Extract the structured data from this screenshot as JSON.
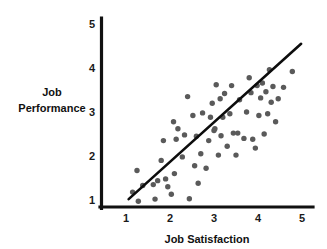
{
  "chart_data": {
    "type": "scatter",
    "title": "",
    "xlabel": "Job Satisfaction",
    "ylabel": "Job Performance",
    "ylabel_line1": "Job",
    "ylabel_line2": "Performance",
    "xlim": [
      0.62,
      5.25
    ],
    "ylim": [
      0.62,
      5.15
    ],
    "xticks": [
      1,
      2,
      3,
      4,
      5
    ],
    "yticks": [
      1,
      2,
      3,
      4,
      5
    ],
    "xtick_labels": [
      "1",
      "2",
      "3",
      "4",
      "5"
    ],
    "ytick_labels": [
      "1",
      "2",
      "3",
      "4",
      "5"
    ],
    "grid": false,
    "legend": false,
    "legend_position": "none",
    "marker_color": "#5a5a5a",
    "marker_size_px": 5.4,
    "axis_color": "#111111",
    "trendline": {
      "label": "linear fit",
      "color": "#0d0d0d",
      "x_start": 1.06,
      "y_start": 1.02,
      "x_end": 4.98,
      "y_end": 4.55
    },
    "points": [
      {
        "x": 1.15,
        "y": 1.18
      },
      {
        "x": 1.25,
        "y": 1.67
      },
      {
        "x": 1.28,
        "y": 0.97
      },
      {
        "x": 1.38,
        "y": 1.33
      },
      {
        "x": 1.62,
        "y": 1.35
      },
      {
        "x": 1.66,
        "y": 1.02
      },
      {
        "x": 1.72,
        "y": 1.44
      },
      {
        "x": 1.8,
        "y": 1.9
      },
      {
        "x": 1.85,
        "y": 2.35
      },
      {
        "x": 1.95,
        "y": 1.3
      },
      {
        "x": 2.03,
        "y": 1.13
      },
      {
        "x": 2.08,
        "y": 2.78
      },
      {
        "x": 2.1,
        "y": 1.6
      },
      {
        "x": 2.14,
        "y": 2.38
      },
      {
        "x": 2.18,
        "y": 2.62
      },
      {
        "x": 2.28,
        "y": 1.98
      },
      {
        "x": 2.33,
        "y": 2.48
      },
      {
        "x": 2.4,
        "y": 3.35
      },
      {
        "x": 2.44,
        "y": 1.03
      },
      {
        "x": 2.52,
        "y": 2.92
      },
      {
        "x": 2.56,
        "y": 1.78
      },
      {
        "x": 2.6,
        "y": 2.45
      },
      {
        "x": 2.64,
        "y": 1.38
      },
      {
        "x": 2.7,
        "y": 2.05
      },
      {
        "x": 2.82,
        "y": 1.72
      },
      {
        "x": 2.88,
        "y": 2.35
      },
      {
        "x": 2.92,
        "y": 2.88
      },
      {
        "x": 2.96,
        "y": 3.2
      },
      {
        "x": 3.0,
        "y": 2.58
      },
      {
        "x": 3.05,
        "y": 3.62
      },
      {
        "x": 3.1,
        "y": 2.02
      },
      {
        "x": 3.14,
        "y": 3.3
      },
      {
        "x": 3.16,
        "y": 2.46
      },
      {
        "x": 3.2,
        "y": 2.88
      },
      {
        "x": 3.24,
        "y": 3.42
      },
      {
        "x": 3.3,
        "y": 2.22
      },
      {
        "x": 3.36,
        "y": 2.96
      },
      {
        "x": 3.4,
        "y": 3.6
      },
      {
        "x": 3.44,
        "y": 2.52
      },
      {
        "x": 3.5,
        "y": 2.02
      },
      {
        "x": 3.54,
        "y": 2.52
      },
      {
        "x": 3.58,
        "y": 3.28
      },
      {
        "x": 3.68,
        "y": 2.4
      },
      {
        "x": 3.74,
        "y": 3.0
      },
      {
        "x": 3.8,
        "y": 3.78
      },
      {
        "x": 3.84,
        "y": 3.44
      },
      {
        "x": 3.88,
        "y": 2.38
      },
      {
        "x": 3.94,
        "y": 2.18
      },
      {
        "x": 3.98,
        "y": 3.6
      },
      {
        "x": 4.02,
        "y": 2.92
      },
      {
        "x": 4.06,
        "y": 3.32
      },
      {
        "x": 4.1,
        "y": 3.66
      },
      {
        "x": 4.14,
        "y": 2.5
      },
      {
        "x": 4.18,
        "y": 3.46
      },
      {
        "x": 4.22,
        "y": 2.96
      },
      {
        "x": 4.26,
        "y": 3.96
      },
      {
        "x": 4.3,
        "y": 3.22
      },
      {
        "x": 4.34,
        "y": 3.58
      },
      {
        "x": 4.4,
        "y": 2.78
      },
      {
        "x": 4.46,
        "y": 3.3
      },
      {
        "x": 4.58,
        "y": 3.56
      },
      {
        "x": 4.78,
        "y": 3.92
      },
      {
        "x": 3.02,
        "y": 2.62
      },
      {
        "x": 2.74,
        "y": 2.98
      },
      {
        "x": 1.9,
        "y": 1.48
      }
    ]
  }
}
